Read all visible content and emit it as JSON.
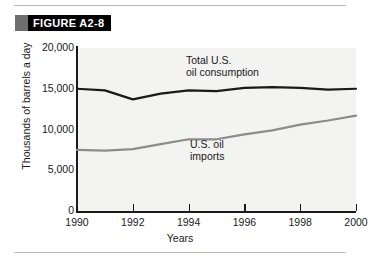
{
  "figure": {
    "banner_label": "FIGURE A2-8",
    "banner_bg": "#000000",
    "banner_swatch_color": "#6e6e6e",
    "banner_text_color": "#ffffff"
  },
  "chart_data": {
    "type": "line",
    "title": "",
    "xlabel": "Years",
    "ylabel": "Thousands of barrels a day",
    "x": [
      1990,
      1991,
      1992,
      1993,
      1994,
      1995,
      1996,
      1997,
      1998,
      1999,
      2000
    ],
    "xlim": [
      1990,
      2000
    ],
    "ylim": [
      0,
      20000
    ],
    "xticks": [
      "1990",
      "1992",
      "1994",
      "1996",
      "1998",
      "2000"
    ],
    "xtick_values": [
      1990,
      1992,
      1994,
      1996,
      1998,
      2000
    ],
    "yticks": [
      "0",
      "5,000",
      "10,000",
      "15,000",
      "20,000"
    ],
    "ytick_values": [
      0,
      5000,
      10000,
      15000,
      20000
    ],
    "grid": false,
    "legend_position": "inline-annotation",
    "plot_background": "#f3f3f1",
    "series": [
      {
        "name": "Total U.S. oil consumption",
        "label_line1": "Total U.S.",
        "label_line2": "oil consumption",
        "color": "#1a1a1a",
        "width": 2.2,
        "values": [
          15000,
          14800,
          13700,
          14400,
          14800,
          14700,
          15100,
          15200,
          15100,
          14900,
          15000
        ]
      },
      {
        "name": "U.S. oil imports",
        "label_line1": "U.S. oil",
        "label_line2": "imports",
        "color": "#8c8c8c",
        "width": 2.2,
        "values": [
          7500,
          7400,
          7600,
          8200,
          8800,
          8800,
          9400,
          9900,
          10600,
          11100,
          11700
        ]
      }
    ]
  },
  "rules": {
    "top_visible": true,
    "bottom_visible": true,
    "color": "#b9b9b9"
  }
}
